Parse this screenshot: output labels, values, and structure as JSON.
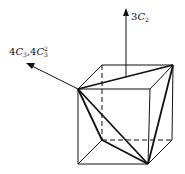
{
  "figure": {
    "labels": {
      "c2_axis": {
        "coef": "3",
        "symbol": "C",
        "sub": "2"
      },
      "c3_axis": {
        "coef1": "4",
        "symbol1": "C",
        "sub1": "3",
        "sep": ",",
        "coef2": "4",
        "symbol2": "C",
        "sub2": "3",
        "sup2": "2"
      }
    },
    "colors": {
      "line": "#111111",
      "background": "#ffffff"
    }
  }
}
